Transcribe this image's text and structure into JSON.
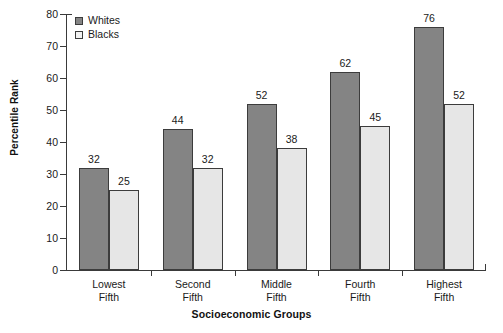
{
  "chart_data": {
    "type": "bar",
    "title": "",
    "xlabel": "Socioeconomic Groups",
    "ylabel": "Percentile Rank",
    "categories": [
      "Lowest Fifth",
      "Second Fifth",
      "Middle Fifth",
      "Fourth Fifth",
      "Highest Fifth"
    ],
    "category_lines": [
      [
        "Lowest",
        "Fifth"
      ],
      [
        "Second",
        "Fifth"
      ],
      [
        "Middle",
        "Fifth"
      ],
      [
        "Fourth",
        "Fifth"
      ],
      [
        "Highest",
        "Fifth"
      ]
    ],
    "series": [
      {
        "name": "Whites",
        "values": [
          32,
          44,
          52,
          62,
          76
        ],
        "color": "#848484"
      },
      {
        "name": "Blacks",
        "values": [
          25,
          32,
          38,
          45,
          52
        ],
        "color": "#e6e6e6"
      }
    ],
    "ylim": [
      0,
      80
    ],
    "yticks": [
      0,
      10,
      20,
      30,
      40,
      50,
      60,
      70,
      80
    ],
    "ytick_labels": [
      "0",
      "10",
      "20",
      "30",
      "40",
      "50",
      "60",
      "70",
      "80"
    ],
    "grid": false,
    "legend_position": "top-left",
    "data_labels": true
  },
  "legend": {
    "items": [
      {
        "label": "Whites",
        "swatch": "whites-swatch"
      },
      {
        "label": "Blacks",
        "swatch": "blacks-swatch"
      }
    ]
  },
  "axes": {
    "y_title": "Percentile Rank",
    "x_title": "Socioeconomic Groups"
  }
}
